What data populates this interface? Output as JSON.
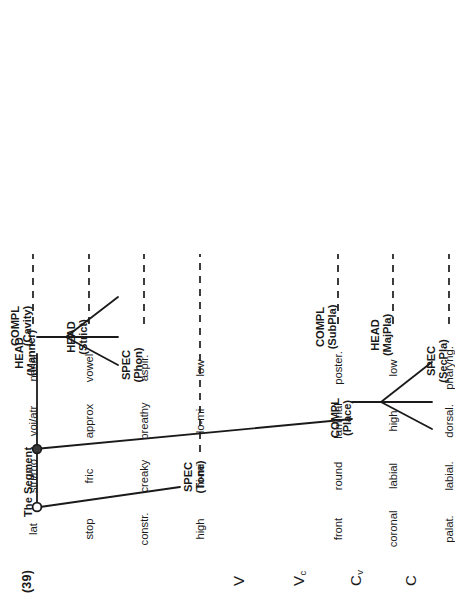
{
  "figure": {
    "example_number": "(39)",
    "title": "The Segment",
    "root_node_style": "open-circle",
    "inner_node_style": "filled-circle"
  },
  "nodes": {
    "spec_tone": {
      "line1": "SPEC",
      "line2": "(Tone)"
    },
    "head_manner": {
      "line1": "HEAD",
      "line2": "(Manner)"
    },
    "compl_place": {
      "line1": "COMPL",
      "line2": "(Place)"
    },
    "spec_phon": {
      "line1": "SPEC",
      "line2": "(Phon)"
    },
    "head_strict": {
      "line1": "HEAD",
      "line2": "(Strict)"
    },
    "compl_cavity": {
      "line1": "COMPL",
      "line2": "(Cavity)"
    },
    "spec_secpla": {
      "line1": "SPEC",
      "line2": "(SecPla)"
    },
    "head_majpla": {
      "line1": "HEAD",
      "line2": "(MajPla)"
    },
    "compl_subpla": {
      "line1": "COMPL",
      "line2": "(SubPla)"
    }
  },
  "row_headers": [
    {
      "base": "C",
      "sub": ""
    },
    {
      "base": "C",
      "sub": "v"
    },
    {
      "base": "V",
      "sub": "c"
    },
    {
      "base": "V",
      "sub": ""
    }
  ],
  "columns": [
    {
      "terminal": "spec_tone",
      "values": [
        "high",
        "hi-mi",
        "lo-mi",
        "low"
      ]
    },
    {
      "terminal": "spec_phon",
      "values": [
        "constr.",
        "creaky",
        "breathy",
        "aspir."
      ]
    },
    {
      "terminal": "head_strict",
      "values": [
        "stop",
        "fric",
        "approx",
        "vowel"
      ]
    },
    {
      "terminal": "compl_cavity",
      "values": [
        "lat",
        "stri/rho",
        "voi/atr",
        "nasal"
      ]
    },
    {
      "terminal": "spec_secpla",
      "values": [
        "palat.",
        "labial.",
        "dorsal.",
        "pharyng."
      ]
    },
    {
      "terminal": "head_majpla",
      "values": [
        "coronal",
        "labial",
        "high",
        "low"
      ]
    },
    {
      "terminal": "compl_subpla",
      "values": [
        "front",
        "round",
        "laminal",
        "poster."
      ]
    }
  ],
  "colors": {
    "ink": "#1a1a1a",
    "page": "#ffffff"
  }
}
